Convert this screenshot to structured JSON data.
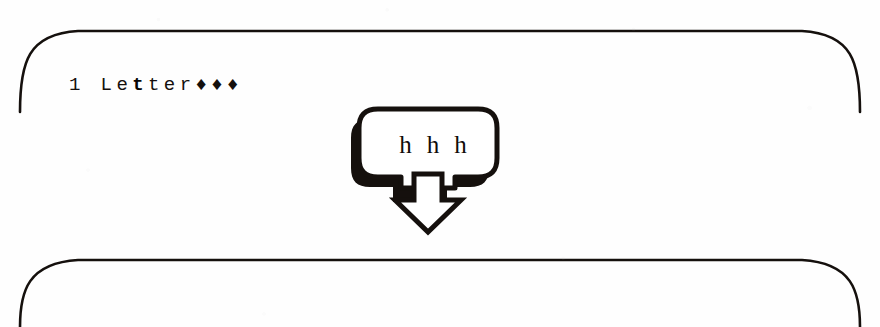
{
  "figure": {
    "kind": "keystroke-instruction-figure",
    "background_color": "#ffffff",
    "ink_color": "#15100d"
  },
  "panel_top": {
    "name": "screen-before",
    "text_plain": "1 Letter...",
    "text_prefix": "1 Le",
    "text_bold": "t",
    "text_suffix": "ter♦♦♦",
    "border_color": "#15100d"
  },
  "panel_bottom": {
    "name": "screen-after",
    "text_plain": "1 Letter...",
    "text_prefix": "1 ",
    "text_bold": "L",
    "text_suffix": "etter♦♦♦",
    "border_color": "#15100d"
  },
  "keystroke": {
    "name": "keystroke-callout",
    "keys": [
      "h",
      "h",
      "h"
    ],
    "key_1": "h",
    "key_2": "h",
    "key_3": "h",
    "shadow_color": "#15100d",
    "fill_color": "#ffffff",
    "arrow_direction": "down"
  }
}
